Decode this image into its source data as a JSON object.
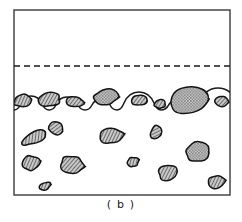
{
  "figure": {
    "caption": "( b )",
    "panel_label": "b",
    "type": "line-art schematic",
    "colors": {
      "background": "#ffffff",
      "ink": "#1a1a1a",
      "frame": "#3a3a3a",
      "particle_fill": "#9a9a9a",
      "particle_outline": "#141414",
      "dashed_line": "#1a1a1a"
    },
    "frame": {
      "name": "plot-border",
      "x": 14,
      "y": 10,
      "width": 216,
      "height": 185,
      "stroke_width": 1.4
    },
    "dashed_reference_line": {
      "name": "original-surface-level",
      "y": 66,
      "x_start": 14,
      "x_end": 230,
      "dash": "6 4",
      "stroke_width": 1.6
    },
    "surface_profile": {
      "name": "eroded-surface-interface",
      "baseline_y": 110,
      "stroke_width": 1.5,
      "path": "M14,110 C17,110 19,108 21,104 C23,99 26,96 31,96 C36,96 40,99 42,104 C44,108 46,110 49,110 C52,110 54,109 56,105 C58,100 62,97 67,97 C72,97 76,100 78,105 C80,109 82,110 85,110 C88,110 90,109 92,105 C94,101 97,99 101,99 C105,99 108,101 110,105 C112,109 114,110 117,110 C120,110 122,108 124,103 C127,96 132,92 139,92 C146,92 151,96 154,103 C156,108 158,110 161,110 C164,110 166,109 168,106 C170,102 173,100 177,100 C181,100 184,102 186,106 C188,109 190,110 193,110 C196,110 197,108 199,103 C202,94 209,88 218,88 C227,88 234,94 237,103 C238,107 240,110 243,110"
    },
    "surface_particles": [
      {
        "name": "surface-particle-1",
        "cx": 22,
        "cy": 101,
        "rx": 9,
        "ry": 6.5,
        "rot": -12,
        "texture": "hatch"
      },
      {
        "name": "surface-particle-2",
        "cx": 50,
        "cy": 100,
        "rx": 11,
        "ry": 7,
        "rot": -6,
        "texture": "hatch"
      },
      {
        "name": "surface-particle-3",
        "cx": 75,
        "cy": 102,
        "rx": 9,
        "ry": 5.5,
        "rot": 3,
        "texture": "hatch"
      },
      {
        "name": "surface-particle-4",
        "cx": 105,
        "cy": 98,
        "rx": 13,
        "ry": 9,
        "rot": -4,
        "texture": "stipple"
      },
      {
        "name": "surface-particle-5",
        "cx": 139,
        "cy": 100,
        "rx": 9,
        "ry": 6,
        "rot": 2,
        "texture": "hatch"
      },
      {
        "name": "surface-particle-6",
        "cx": 160,
        "cy": 104,
        "rx": 6,
        "ry": 4.5,
        "rot": -3,
        "texture": "hatch"
      },
      {
        "name": "surface-particle-7",
        "cx": 190,
        "cy": 100,
        "rx": 22,
        "ry": 15,
        "rot": -3,
        "texture": "stipple"
      },
      {
        "name": "surface-particle-8",
        "cx": 222,
        "cy": 101,
        "rx": 7,
        "ry": 5.5,
        "rot": 8,
        "texture": "hatch"
      }
    ],
    "embedded_particles": [
      {
        "name": "embedded-particle-1",
        "cx": 35,
        "cy": 137,
        "rx": 15,
        "ry": 6.5,
        "rot": -28,
        "texture": "hatch"
      },
      {
        "name": "embedded-particle-2",
        "cx": 56,
        "cy": 129,
        "rx": 8,
        "ry": 6.5,
        "rot": 18,
        "texture": "hatch"
      },
      {
        "name": "embedded-particle-3",
        "cx": 111,
        "cy": 136,
        "rx": 13,
        "ry": 8,
        "rot": -10,
        "texture": "hatch"
      },
      {
        "name": "embedded-particle-4",
        "cx": 156,
        "cy": 132,
        "rx": 5.5,
        "ry": 7,
        "rot": 28,
        "texture": "hatch"
      },
      {
        "name": "embedded-particle-5",
        "cx": 198,
        "cy": 152,
        "rx": 14,
        "ry": 10,
        "rot": -6,
        "texture": "stipple"
      },
      {
        "name": "embedded-particle-6",
        "cx": 31,
        "cy": 163,
        "rx": 10,
        "ry": 8,
        "rot": -12,
        "texture": "hatch"
      },
      {
        "name": "embedded-particle-7",
        "cx": 72,
        "cy": 165,
        "rx": 13,
        "ry": 9,
        "rot": 6,
        "texture": "hatch"
      },
      {
        "name": "embedded-particle-8",
        "cx": 133,
        "cy": 162,
        "rx": 6,
        "ry": 5,
        "rot": -20,
        "texture": "hatch"
      },
      {
        "name": "embedded-particle-9",
        "cx": 168,
        "cy": 172,
        "rx": 11,
        "ry": 8,
        "rot": -8,
        "texture": "hatch"
      },
      {
        "name": "embedded-particle-10",
        "cx": 45,
        "cy": 186,
        "rx": 6,
        "ry": 4,
        "rot": -14,
        "texture": "hatch"
      },
      {
        "name": "embedded-particle-11",
        "cx": 216,
        "cy": 182,
        "rx": 9,
        "ry": 6.5,
        "rot": -10,
        "texture": "hatch"
      }
    ]
  }
}
